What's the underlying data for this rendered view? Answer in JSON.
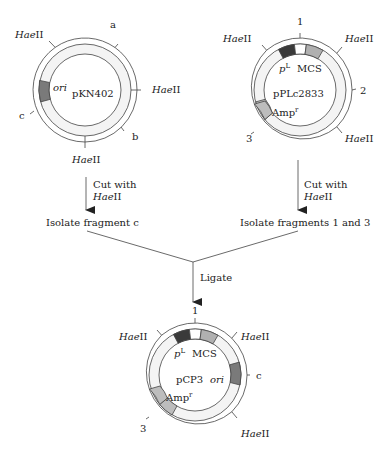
{
  "colors": {
    "ring_fill": "#f4f4f4",
    "stroke": "#444444",
    "ori": "#7a7a7a",
    "promoter": "#3a3a3a",
    "amp": "#bdbdbd",
    "mcs_gray": "#b0b0b0",
    "white": "#ffffff"
  },
  "enzyme": {
    "italic": "Hae",
    "roman": "II"
  },
  "plasmid1": {
    "name": "pKN402",
    "ori_label": "ori",
    "fragments": [
      "a",
      "b",
      "c"
    ],
    "step_label_line1": "Cut with",
    "step_label_enzyme_italic": "Hae",
    "step_label_enzyme_roman": "II",
    "result": "Isolate fragment c"
  },
  "plasmid2": {
    "name": "pPLc2833",
    "promoter_label": "p",
    "promoter_sup": "L",
    "mcs_label": "MCS",
    "amp_label": "Amp",
    "amp_sup": "r",
    "fragments": [
      "1",
      "2",
      "3"
    ],
    "step_label_line1": "Cut with",
    "step_label_enzyme_italic": "Hae",
    "step_label_enzyme_roman": "II",
    "result": "Isolate fragments 1 and 3"
  },
  "ligate_label": "Ligate",
  "plasmid3": {
    "name": "pCP3",
    "promoter_label": "p",
    "promoter_sup": "L",
    "mcs_label": "MCS",
    "ori_label": "ori",
    "amp_label": "Amp",
    "amp_sup": "r",
    "fragments": [
      "1",
      "c",
      "3"
    ]
  }
}
